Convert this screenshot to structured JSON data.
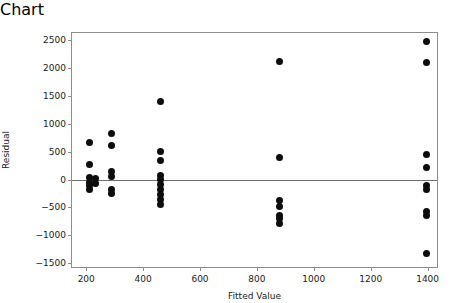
{
  "chart_data": {
    "type": "scatter",
    "title": "",
    "xlabel": "Fitted Value",
    "ylabel": "Residual",
    "xlim": [
      150,
      1440
    ],
    "ylim": [
      -1600,
      2620
    ],
    "xticks": [
      200,
      400,
      600,
      800,
      1000,
      1200,
      1400
    ],
    "xtick_labels": [
      "200",
      "400",
      "600",
      "800",
      "1000",
      "1200",
      "1400"
    ],
    "yticks": [
      -1500,
      -1000,
      -500,
      0,
      500,
      1000,
      1500,
      2000,
      2500
    ],
    "ytick_labels": [
      "-1500",
      "-1000",
      "-500",
      "0",
      "500",
      "1000",
      "1500",
      "2000",
      "2500"
    ],
    "grid": false,
    "legend": "none",
    "reference_line": {
      "orientation": "horizontal",
      "y": 0,
      "color": "#6f6f6f"
    },
    "marker": {
      "shape": "circle",
      "color": "#0d0d0d",
      "size": 7
    },
    "points": [
      {
        "x": 212,
        "y": 660
      },
      {
        "x": 212,
        "y": 270
      },
      {
        "x": 212,
        "y": 40
      },
      {
        "x": 212,
        "y": -60
      },
      {
        "x": 212,
        "y": -110
      },
      {
        "x": 212,
        "y": -180
      },
      {
        "x": 232,
        "y": 20
      },
      {
        "x": 232,
        "y": -70
      },
      {
        "x": 290,
        "y": 830
      },
      {
        "x": 290,
        "y": 600
      },
      {
        "x": 290,
        "y": 140
      },
      {
        "x": 290,
        "y": 50
      },
      {
        "x": 290,
        "y": -170
      },
      {
        "x": 290,
        "y": -250
      },
      {
        "x": 460,
        "y": 1390
      },
      {
        "x": 460,
        "y": 500
      },
      {
        "x": 460,
        "y": 340
      },
      {
        "x": 460,
        "y": 70
      },
      {
        "x": 460,
        "y": 0
      },
      {
        "x": 460,
        "y": -90
      },
      {
        "x": 460,
        "y": -180
      },
      {
        "x": 460,
        "y": -270
      },
      {
        "x": 460,
        "y": -360
      },
      {
        "x": 460,
        "y": -440
      },
      {
        "x": 880,
        "y": 2110
      },
      {
        "x": 880,
        "y": 390
      },
      {
        "x": 880,
        "y": -380
      },
      {
        "x": 880,
        "y": -480
      },
      {
        "x": 880,
        "y": -650
      },
      {
        "x": 880,
        "y": -700
      },
      {
        "x": 880,
        "y": -780
      },
      {
        "x": 1395,
        "y": 2460
      },
      {
        "x": 1395,
        "y": 2090
      },
      {
        "x": 1395,
        "y": 450
      },
      {
        "x": 1395,
        "y": 220
      },
      {
        "x": 1395,
        "y": -110
      },
      {
        "x": 1395,
        "y": -180
      },
      {
        "x": 1395,
        "y": -580
      },
      {
        "x": 1395,
        "y": -640
      },
      {
        "x": 1395,
        "y": -1320
      }
    ]
  }
}
